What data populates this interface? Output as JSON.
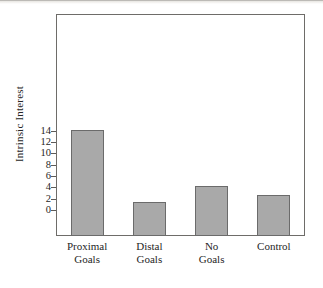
{
  "chart_data": {
    "type": "bar",
    "title": "",
    "xlabel": "",
    "ylabel": "Intrinsic Interest",
    "categories": [
      "Proximal\nGoals",
      "Distal\nGoals",
      "No\nGoals",
      "Control"
    ],
    "values": [
      14.1,
      1.4,
      4.2,
      2.7
    ],
    "ylim": [
      0,
      15
    ],
    "yticks": [
      0,
      2,
      4,
      6,
      8,
      10,
      12,
      14
    ],
    "ytick_labels": [
      "0",
      "2",
      "4",
      "6",
      "8",
      "10",
      "12",
      "14"
    ],
    "grid": false,
    "legend": null,
    "bar_color": "#a9a9a9",
    "bar_edge_color": "#6b6b6b",
    "frame_color": "#6e6c69"
  },
  "figure": {
    "background": "#ffffff",
    "axis_label_color": "#262626"
  }
}
